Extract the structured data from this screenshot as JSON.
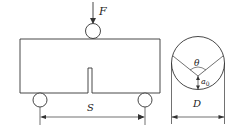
{
  "figure": {
    "type": "three-point bending test schematic",
    "labels": {
      "load": "F",
      "span": "S",
      "diameter": "D",
      "angle": "θ",
      "notch_depth": "a",
      "notch_depth_sub": "0"
    },
    "colors": {
      "stroke": "#333333",
      "background": "#ffffff"
    }
  }
}
